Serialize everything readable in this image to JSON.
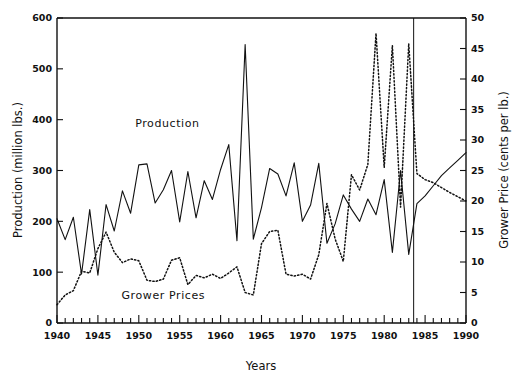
{
  "chart_data": {
    "type": "line",
    "title": "",
    "xlabel": "Years",
    "ylabel": "Production (million lbs.)",
    "ylabel_right": "Grower Price (cents per lb.)",
    "xlim": [
      1940,
      1990
    ],
    "ylim": [
      0,
      600
    ],
    "ylim_right": [
      0,
      50
    ],
    "xticks": [
      1940,
      1945,
      1950,
      1955,
      1960,
      1965,
      1970,
      1975,
      1980,
      1985,
      1990
    ],
    "xtick_labels": [
      "1940",
      "1945",
      "1950",
      "1955",
      "1960",
      "1965",
      "1970",
      "1975",
      "1980",
      "1985",
      "1990"
    ],
    "xminor_step": 1,
    "yticks": [
      0,
      100,
      200,
      300,
      400,
      500,
      600
    ],
    "ytick_labels": [
      "0",
      "100",
      "200",
      "300",
      "400",
      "500",
      "600"
    ],
    "yticks_right": [
      0,
      5,
      10,
      15,
      20,
      25,
      30,
      35,
      40,
      45,
      50
    ],
    "ytick_labels_right": [
      "0",
      "5",
      "10",
      "15",
      "20",
      "25",
      "30",
      "35",
      "40",
      "45",
      "50"
    ],
    "grid": false,
    "legend_position": "inline-annotations",
    "annotations": [
      {
        "text": "Production",
        "x": 1953.5,
        "y": 385,
        "axis": "left"
      },
      {
        "text": "Grower Prices",
        "x": 1953.0,
        "y": 48,
        "axis": "left"
      }
    ],
    "vertical_divider": {
      "x": 1983.6,
      "note": "actual vs projected boundary"
    },
    "x": [
      1940,
      1941,
      1942,
      1943,
      1944,
      1945,
      1946,
      1947,
      1948,
      1949,
      1950,
      1951,
      1952,
      1953,
      1954,
      1955,
      1956,
      1957,
      1958,
      1959,
      1960,
      1961,
      1962,
      1963,
      1964,
      1965,
      1966,
      1967,
      1968,
      1969,
      1970,
      1971,
      1972,
      1973,
      1974,
      1975,
      1976,
      1977,
      1978,
      1979,
      1980,
      1981,
      1982,
      1983,
      1984,
      1985,
      1986,
      1987,
      1988,
      1989,
      1990
    ],
    "series": [
      {
        "name": "Production",
        "axis": "left",
        "units": "million lbs.",
        "style": "solid",
        "values": [
          205,
          164,
          208,
          96,
          223,
          94,
          233,
          181,
          260,
          216,
          311,
          313,
          236,
          262,
          300,
          199,
          298,
          207,
          280,
          243,
          302,
          351,
          162,
          548,
          165,
          227,
          304,
          293,
          250,
          315,
          200,
          232,
          314,
          157,
          195,
          252,
          224,
          200,
          244,
          213,
          282,
          139,
          300,
          135,
          235,
          250,
          270,
          290,
          305,
          320,
          335
        ]
      },
      {
        "name": "Grower Prices",
        "axis": "right",
        "units": "cents per lb.",
        "style": "dotted",
        "values": [
          3.0,
          4.6,
          5.3,
          8.5,
          8.2,
          12.2,
          14.9,
          11.6,
          9.9,
          10.5,
          10.2,
          7.0,
          6.8,
          7.2,
          10.3,
          10.7,
          6.3,
          7.8,
          7.4,
          8.0,
          7.3,
          8.2,
          9.2,
          5.0,
          4.6,
          13.0,
          15.0,
          15.2,
          8.0,
          7.7,
          8.0,
          7.2,
          11.2,
          19.6,
          13.8,
          10.1,
          24.3,
          21.8,
          26.0,
          47.5,
          25.5,
          45.5,
          19.0,
          45.8,
          24.5,
          23.5,
          23.0,
          22.2,
          21.4,
          20.7,
          20.0
        ]
      }
    ]
  },
  "axis": {
    "left_title": "Production (million lbs.)",
    "right_title": "Grower Price (cents per lb.)",
    "bottom_title": "Years"
  },
  "labels": {
    "production": "Production",
    "grower_prices": "Grower Prices"
  },
  "colors": {
    "foreground": "#111111",
    "background": "#ffffff"
  }
}
